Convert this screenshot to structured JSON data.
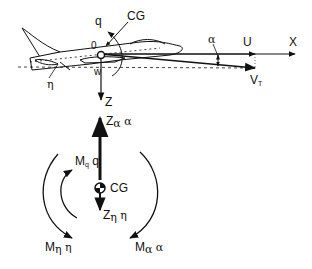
{
  "figure": {
    "type": "aircraft longitudinal force and moment diagram",
    "colors": {
      "stroke": "#111111",
      "background": "#ffffff"
    }
  },
  "labels": {
    "q": "q",
    "cg_top": "CG",
    "origin": "0",
    "w": "w",
    "eta": "η",
    "z_axis": "Z",
    "alpha_top": "α",
    "u": "U",
    "x_axis": "X",
    "vt_main": "V",
    "vt_sub": "T",
    "z_alpha_main": "Z",
    "z_alpha_sub": "α",
    "z_alpha_var": "α",
    "m_q_main": "M",
    "m_q_sub": "q",
    "m_q_var": "q",
    "cg_bottom": "CG",
    "z_eta_main": "Z",
    "z_eta_sub": "η",
    "z_eta_var": "η",
    "m_eta_main": "M",
    "m_eta_sub": "η",
    "m_eta_var": "η",
    "m_alpha_main": "M",
    "m_alpha_sub": "α",
    "m_alpha_var": "α"
  }
}
